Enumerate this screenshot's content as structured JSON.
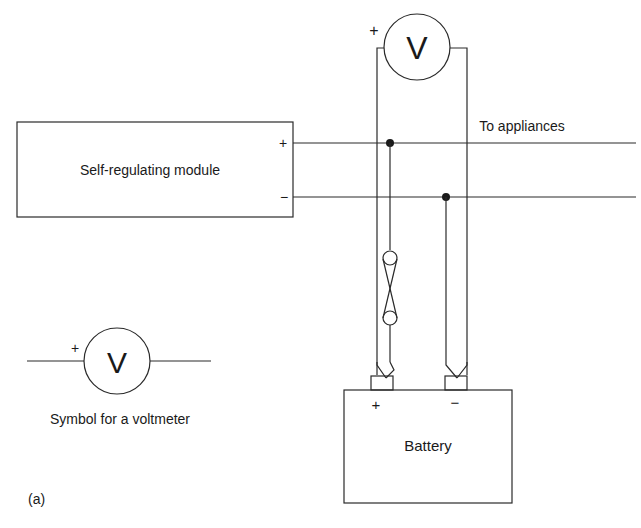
{
  "diagram": {
    "module_label": "Self-regulating module",
    "module_plus": "+",
    "module_minus": "−",
    "to_appliances_label": "To appliances",
    "voltmeter_main": {
      "letter": "V",
      "plus": "+"
    },
    "voltmeter_legend": {
      "letter": "V",
      "plus": "+",
      "caption": "Symbol for a voltmeter"
    },
    "battery": {
      "label": "Battery",
      "plus": "+",
      "minus": "−"
    },
    "figure_label": "(a)"
  },
  "colors": {
    "line": "#2a2a2a",
    "text": "#1a1a1a",
    "background": "#ffffff"
  }
}
